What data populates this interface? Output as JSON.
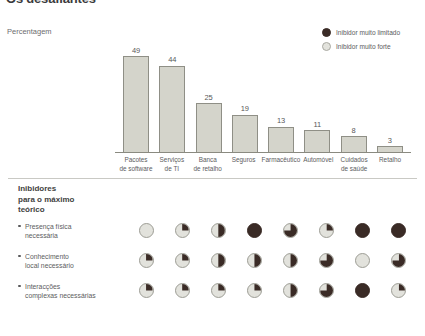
{
  "title": "Os desafiantes",
  "axis_caption": "Percentagem",
  "legend": {
    "items": [
      {
        "swatch": "dark-circle-icon",
        "label": "Inibidor muito limitado",
        "color": "#3a2b26"
      },
      {
        "swatch": "light-circle-icon",
        "label": "Inibidor muito forte",
        "color": "#e2e2dc"
      }
    ]
  },
  "chart_data": {
    "type": "bar",
    "title": "Os desafiantes",
    "ylabel": "Percentagem",
    "xlabel": "",
    "ylim": [
      0,
      49
    ],
    "grid": false,
    "categories": [
      "Pacotes de software",
      "Serviços de TI",
      "Banca de retalho",
      "Seguros",
      "Farmacêutico",
      "Automóvel",
      "Cuidados de saúde",
      "Retalho"
    ],
    "category_lines": [
      [
        "Pacotes",
        "de software"
      ],
      [
        "Serviços",
        "de TI"
      ],
      [
        "Banca",
        "de retalho"
      ],
      [
        "Seguros",
        ""
      ],
      [
        "Farmacêutico",
        ""
      ],
      [
        "Automóvel",
        ""
      ],
      [
        "Cuidados",
        "de saúde"
      ],
      [
        "Retalho",
        ""
      ]
    ],
    "values": [
      49,
      44,
      25,
      19,
      13,
      11,
      8,
      3
    ],
    "bar_color": "#d4d4cb",
    "bar_border": "#8f8f86"
  },
  "matrix": {
    "heading": "Inibidores\npara o máximo\nteórico",
    "heading_lines": [
      "Inibidores",
      "para o máximo",
      "teórico"
    ],
    "scale": "0 = Inibidor muito limitado ... 100 = Inibidor muito forte",
    "columns": [
      "Pacotes de software",
      "Serviços de TI",
      "Banca de retalho",
      "Seguros",
      "Farmacêutico",
      "Automóvel",
      "Cuidados de saúde",
      "Retalho"
    ],
    "rows": [
      {
        "label": "Presença física necessária",
        "label_lines": [
          "Presença física",
          "necessária"
        ],
        "values": [
          0,
          25,
          50,
          100,
          75,
          25,
          100,
          100
        ]
      },
      {
        "label": "Conhecimento local necessário",
        "label_lines": [
          "Conhecimento",
          "local necessário"
        ],
        "values": [
          25,
          25,
          50,
          50,
          50,
          75,
          0,
          75
        ]
      },
      {
        "label": "Interacções complexas necessárias",
        "label_lines": [
          "Interacções",
          "complexas necessárias"
        ],
        "values": [
          25,
          25,
          25,
          25,
          50,
          75,
          100,
          25
        ]
      }
    ]
  }
}
